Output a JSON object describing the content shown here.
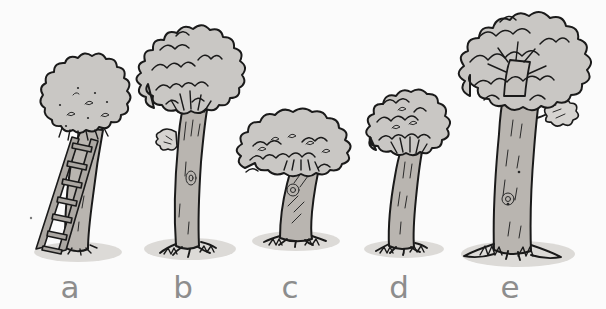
{
  "scene": {
    "title": "Five trees comparison illustration",
    "width": 606,
    "height": 309,
    "background_color": "#fbfbfb",
    "style": "hand-drawn cartoon line art, grayscale"
  },
  "palette": {
    "background": "#fbfbfb",
    "ink": "#1a1a1a",
    "canopy_fill": "#c9c7c4",
    "canopy_fill_light": "#d6d4d1",
    "trunk_fill": "#b9b5b0",
    "trunk_fill_light": "#c6c3bf",
    "ground_shadow": "#dddbd8",
    "label_color": "#8d8d8d",
    "ladder_fill": "#a8a49f"
  },
  "labels": [
    {
      "id": "a",
      "text": "a",
      "x": 70,
      "y": 272
    },
    {
      "id": "b",
      "text": "b",
      "x": 183,
      "y": 272
    },
    {
      "id": "c",
      "text": "c",
      "x": 290,
      "y": 272
    },
    {
      "id": "d",
      "text": "d",
      "x": 399,
      "y": 272
    },
    {
      "id": "e",
      "text": "e",
      "x": 510,
      "y": 272
    }
  ],
  "trees": [
    {
      "id": "a",
      "label": "a",
      "description": "short tree with a dotted round canopy and a ladder leaning against the trunk",
      "canopy_shape": "round-bumpy",
      "relative_height": "short",
      "has_ladder": true,
      "ladder_rungs": 7,
      "trunk_lean": "slight-right"
    },
    {
      "id": "b",
      "label": "b",
      "description": "tall tree with tall straight trunk and dense spiky canopy",
      "canopy_shape": "spiky-ruffled",
      "relative_height": "tall",
      "has_ladder": false,
      "trunk_knot": true
    },
    {
      "id": "c",
      "label": "c",
      "description": "short wide tree with a flat mushroom-like canopy and thick tapered trunk",
      "canopy_shape": "wide-flat",
      "relative_height": "shortest",
      "has_ladder": false,
      "trunk_knot": true
    },
    {
      "id": "d",
      "label": "d",
      "description": "medium tree with a small rounded bushy canopy",
      "canopy_shape": "round-bushy",
      "relative_height": "medium",
      "has_ladder": false
    },
    {
      "id": "e",
      "label": "e",
      "description": "tallest tree with thick trunk, flared roots and a large lobed canopy with one side branch",
      "canopy_shape": "large-lobed",
      "relative_height": "tallest",
      "has_ladder": false,
      "trunk_knot": true,
      "side_branch": true,
      "flared_roots": true
    }
  ]
}
